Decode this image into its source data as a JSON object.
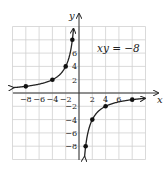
{
  "chart_data": {
    "type": "line",
    "title": "",
    "equation_label": "xy = −8",
    "xlabel": "x",
    "ylabel": "y",
    "xlim": [
      -10,
      10
    ],
    "ylim": [
      -10,
      10
    ],
    "grid": true,
    "grid_step": 2,
    "x_ticks": [
      -8,
      -6,
      -4,
      -2,
      2,
      4,
      6
    ],
    "x_tick_labels": [
      "−8",
      "−6",
      "−4",
      "−2",
      "2",
      "4",
      "6"
    ],
    "y_ticks": [
      8,
      6,
      4,
      2,
      -2,
      -4,
      -6,
      -8
    ],
    "y_tick_labels": [
      "6",
      "4",
      "2",
      "−2",
      "−4",
      "−6",
      "−8"
    ],
    "series": [
      {
        "name": "left branch (x<0)",
        "function": "y = -8/x",
        "points": [
          [
            -8,
            1
          ],
          [
            -4,
            2
          ],
          [
            -2,
            4
          ],
          [
            -1,
            8
          ]
        ]
      },
      {
        "name": "right branch (x>0)",
        "function": "y = -8/x",
        "points": [
          [
            1,
            -8
          ],
          [
            2,
            -4
          ],
          [
            4,
            -2
          ],
          [
            8,
            -1
          ]
        ]
      }
    ],
    "colors": {
      "curve": "#222222",
      "grid": "#d0d0d0",
      "axes": "#333333"
    }
  }
}
